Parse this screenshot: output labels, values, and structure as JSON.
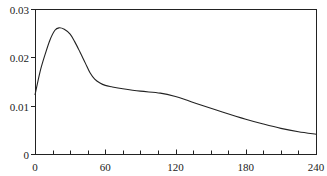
{
  "chart_data": {
    "type": "line",
    "title": "",
    "xlabel": "",
    "ylabel": "",
    "xlim": [
      0,
      240
    ],
    "ylim": [
      0,
      0.03
    ],
    "grid": false,
    "legend": null,
    "x_ticks": [
      0,
      60,
      120,
      180,
      240
    ],
    "x_tick_labels": [
      "0",
      "60",
      "120",
      "180",
      "240"
    ],
    "x_minor_tick_step": 15,
    "y_ticks": [
      0,
      0.01,
      0.02,
      0.03
    ],
    "y_tick_labels": [
      "0",
      "0.01",
      "0.02",
      "0.03"
    ],
    "series": [
      {
        "name": "curve",
        "color": "#222222",
        "x": [
          0,
          4.3,
          8.5,
          12.8,
          17,
          20.5,
          25,
          30,
          34,
          38.4,
          43,
          47,
          51,
          55.5,
          60,
          65.6,
          75,
          90,
          107,
          120,
          130,
          141,
          160,
          180,
          195,
          210,
          225,
          240
        ],
        "y": [
          0.0122,
          0.017,
          0.0205,
          0.0236,
          0.0256,
          0.0261,
          0.0258,
          0.0248,
          0.0232,
          0.0211,
          0.0188,
          0.0168,
          0.0155,
          0.0147,
          0.0142,
          0.0139,
          0.0135,
          0.013,
          0.0126,
          0.0119,
          0.0111,
          0.0102,
          0.0087,
          0.0072,
          0.0062,
          0.0053,
          0.0046,
          0.0041
        ]
      }
    ]
  }
}
